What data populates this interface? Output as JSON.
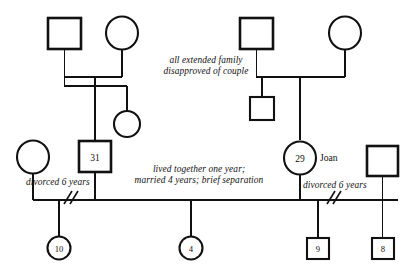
{
  "diagram": {
    "type": "genogram",
    "background_color": "#ffffff",
    "line_color": "#111111"
  },
  "nodes": {
    "paternal_grandfather": {
      "id": "paternal_grandfather",
      "shape": "square",
      "sex": "male",
      "label": "",
      "generation": 1
    },
    "paternal_grandmother": {
      "id": "paternal_grandmother",
      "shape": "circle",
      "sex": "female",
      "label": "",
      "generation": 1
    },
    "maternal_grandfather": {
      "id": "maternal_grandfather",
      "shape": "square",
      "sex": "male",
      "label": "",
      "generation": 1
    },
    "maternal_grandmother": {
      "id": "maternal_grandmother",
      "shape": "circle",
      "sex": "female",
      "label": "",
      "generation": 1
    },
    "paternal_sister": {
      "id": "paternal_sister",
      "shape": "circle",
      "sex": "female",
      "label": "",
      "generation": 2
    },
    "maternal_brother": {
      "id": "maternal_brother",
      "shape": "square",
      "sex": "male",
      "label": "",
      "generation": 2
    },
    "ex_wife": {
      "id": "ex_wife",
      "shape": "circle",
      "sex": "female",
      "label": "",
      "generation": 2
    },
    "husband": {
      "id": "husband",
      "shape": "square",
      "sex": "male",
      "label": "31",
      "generation": 2
    },
    "joan": {
      "id": "joan",
      "shape": "circle",
      "sex": "female",
      "label": "29",
      "name": "Joan",
      "generation": 2
    },
    "ex_husband": {
      "id": "ex_husband",
      "shape": "square",
      "sex": "male",
      "label": "",
      "generation": 2
    },
    "child_10": {
      "id": "child_10",
      "shape": "circle",
      "sex": "female",
      "label": "10",
      "generation": 3
    },
    "child_4": {
      "id": "child_4",
      "shape": "circle",
      "sex": "female",
      "label": "4",
      "generation": 3
    },
    "child_9": {
      "id": "child_9",
      "shape": "square",
      "sex": "male",
      "label": "9",
      "generation": 3
    },
    "child_8": {
      "id": "child_8",
      "shape": "square",
      "sex": "male",
      "label": "8",
      "generation": 3
    }
  },
  "annotations": {
    "extended_family_note_line1": "all extended family",
    "extended_family_note_line2": "disapproved of couple",
    "couple_note_line1": "lived together one year;",
    "couple_note_line2": "married 4 years; brief separation",
    "left_divorce_note": "divorced 6 years",
    "right_divorce_note": "divorced 6 years",
    "joan_name": "Joan"
  }
}
